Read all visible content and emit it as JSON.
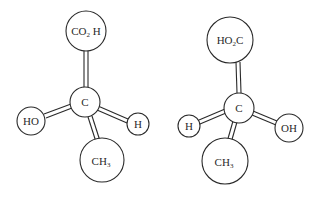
{
  "figure": {
    "type": "ball-and-stick enantiomer models",
    "molecules": [
      {
        "id": "left",
        "center_label": "C",
        "groups": {
          "top": {
            "label_main": "CO",
            "label_sub": "2",
            "label_tail": " H"
          },
          "left": {
            "label": "HO"
          },
          "right": {
            "label": "H"
          },
          "bottom": {
            "label_main": "CH",
            "label_sub": "3"
          }
        }
      },
      {
        "id": "right",
        "center_label": "C",
        "groups": {
          "top": {
            "label_main": "HO",
            "label_sub": "2",
            "label_tail": "C"
          },
          "left": {
            "label": "H"
          },
          "right": {
            "label": "OH"
          },
          "bottom": {
            "label_main": "CH",
            "label_sub": "3"
          }
        }
      }
    ],
    "colors": {
      "stroke": "#2a2a2a",
      "fill": "#ffffff"
    }
  }
}
